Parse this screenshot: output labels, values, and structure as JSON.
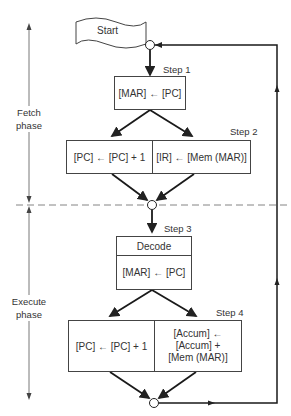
{
  "diagram": {
    "start_label": "Start",
    "phases": {
      "fetch": [
        "Fetch",
        "phase"
      ],
      "execute": [
        "Execute",
        "phase"
      ]
    },
    "steps": {
      "step1": {
        "label": "Step 1",
        "operation": "[MAR] ← [PC]"
      },
      "step2": {
        "label": "Step 2",
        "left": "[PC] ← [PC] + 1",
        "right": "[IR] ← [Mem (MAR)]"
      },
      "step3": {
        "label": "Step 3",
        "header": "Decode",
        "operation": "[MAR] ← [PC]"
      },
      "step4": {
        "label": "Step 4",
        "left": "[PC] ← [PC] + 1",
        "right_lines": [
          "[Accum] ←",
          "[Accum] +",
          "[Mem (MAR)]"
        ]
      }
    }
  }
}
